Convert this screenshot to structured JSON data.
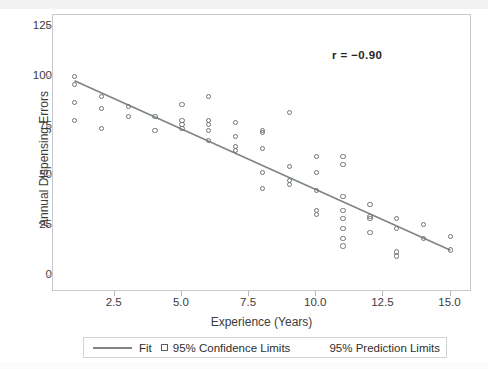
{
  "chart_data": {
    "type": "scatter",
    "title": "",
    "xlabel": "Experience (Years)",
    "ylabel": "Annual Dispensing Errors",
    "xlim": [
      0.2,
      15.8
    ],
    "ylim": [
      -8,
      131
    ],
    "xticks": [
      "2.5",
      "5.0",
      "7.5",
      "10.0",
      "12.5",
      "15.0"
    ],
    "xtick_values": [
      2.5,
      5.0,
      7.5,
      10.0,
      12.5,
      15.0
    ],
    "yticks": [
      "0",
      "25",
      "50",
      "75",
      "100",
      "125"
    ],
    "ytick_values": [
      0,
      25,
      50,
      75,
      100,
      125
    ],
    "grid": false,
    "annotation": "r = −0.90",
    "correlation": -0.9,
    "legend": {
      "position": "below-axes",
      "entries": [
        {
          "label": "Fit",
          "marker": "line",
          "color": "#7f8487"
        },
        {
          "label": "95% Confidence Limits",
          "marker": "open-square",
          "color": "#5c5f62"
        },
        {
          "label": "95% Prediction Limits",
          "marker": "none",
          "color": "#5c5f62"
        }
      ]
    },
    "series": [
      {
        "name": "Observations",
        "marker": "open-circle",
        "color": "#6e7376",
        "points": [
          [
            1,
            100
          ],
          [
            1,
            96
          ],
          [
            1,
            87
          ],
          [
            1,
            78
          ],
          [
            2,
            90
          ],
          [
            2,
            84
          ],
          [
            2,
            74
          ],
          [
            3,
            85
          ],
          [
            3,
            80
          ],
          [
            4,
            80
          ],
          [
            4,
            73
          ],
          [
            5,
            86
          ],
          [
            5,
            78
          ],
          [
            5,
            76
          ],
          [
            5,
            74
          ],
          [
            6,
            90
          ],
          [
            6,
            78
          ],
          [
            6,
            76
          ],
          [
            6,
            73
          ],
          [
            6,
            68
          ],
          [
            7,
            77
          ],
          [
            7,
            70
          ],
          [
            7,
            65
          ],
          [
            7,
            63
          ],
          [
            8,
            73
          ],
          [
            8,
            72
          ],
          [
            8,
            64
          ],
          [
            8,
            52
          ],
          [
            8,
            44
          ],
          [
            9,
            82
          ],
          [
            9,
            55
          ],
          [
            9,
            48
          ],
          [
            9,
            46
          ],
          [
            10,
            60
          ],
          [
            10,
            52
          ],
          [
            10,
            43
          ],
          [
            10,
            33
          ],
          [
            10,
            31
          ],
          [
            11,
            60
          ],
          [
            11,
            56
          ],
          [
            11,
            40
          ],
          [
            11,
            33
          ],
          [
            11,
            29
          ],
          [
            11,
            24
          ],
          [
            11,
            19
          ],
          [
            11,
            15
          ],
          [
            12,
            36
          ],
          [
            12,
            30
          ],
          [
            12,
            29
          ],
          [
            12,
            22
          ],
          [
            13,
            29
          ],
          [
            13,
            24
          ],
          [
            13,
            12
          ],
          [
            13,
            10
          ],
          [
            14,
            26
          ],
          [
            14,
            19
          ],
          [
            15,
            20
          ],
          [
            15,
            13
          ]
        ]
      }
    ],
    "fit_line": {
      "name": "Fit",
      "color": "#7f8487",
      "points": [
        [
          1,
          98
        ],
        [
          15,
          13
        ]
      ]
    }
  }
}
